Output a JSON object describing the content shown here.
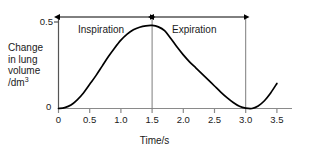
{
  "chart_data": {
    "type": "line",
    "title": "",
    "xlabel": "Time/s",
    "ylabel": "Change in lung volume /dm3",
    "ylabel_lines": [
      "Change",
      "in lung",
      "volume",
      "/dm"
    ],
    "ylabel_superscript": "3",
    "xlim": [
      0,
      3.5
    ],
    "ylim": [
      0,
      0.5
    ],
    "grid": false,
    "legend": "none",
    "xticks": [
      "0",
      "0.5",
      "1.0",
      "1.5",
      "2.0",
      "2.5",
      "3.0",
      "3.5"
    ],
    "xtick_values": [
      0,
      0.5,
      1.0,
      1.5,
      2.0,
      2.5,
      3.0,
      3.5
    ],
    "yticks": [
      "0",
      "0.5"
    ],
    "ytick_values": [
      0,
      0.5
    ],
    "series": [
      {
        "name": "Change in lung volume",
        "x": [
          0.0,
          0.1,
          0.2,
          0.3,
          0.4,
          0.5,
          0.6,
          0.7,
          0.8,
          0.9,
          1.0,
          1.1,
          1.2,
          1.3,
          1.4,
          1.5,
          1.6,
          1.7,
          1.8,
          1.9,
          2.0,
          2.1,
          2.2,
          2.3,
          2.4,
          2.5,
          2.6,
          2.7,
          2.8,
          2.9,
          3.0,
          3.1,
          3.2,
          3.3,
          3.4,
          3.5
        ],
        "values": [
          0.0,
          0.005,
          0.02,
          0.05,
          0.09,
          0.14,
          0.19,
          0.245,
          0.3,
          0.35,
          0.395,
          0.43,
          0.455,
          0.47,
          0.478,
          0.48,
          0.472,
          0.45,
          0.405,
          0.355,
          0.31,
          0.27,
          0.235,
          0.2,
          0.165,
          0.13,
          0.095,
          0.063,
          0.035,
          0.013,
          0.002,
          0.0,
          0.015,
          0.045,
          0.09,
          0.145
        ]
      }
    ],
    "annotations": [
      {
        "label": "Inspiration",
        "type": "double-headed-arrow",
        "x_start": 0.0,
        "x_end": 1.5
      },
      {
        "label": "Expiration",
        "type": "double-headed-arrow",
        "x_start": 1.5,
        "x_end": 3.0
      }
    ],
    "reference_lines": [
      {
        "x": 1.5,
        "orientation": "vertical"
      },
      {
        "x": 3.0,
        "orientation": "vertical"
      }
    ],
    "colors": {
      "curve": "#000000",
      "axis": "#555555",
      "annotation": "#000000",
      "text": "#1a1a1a",
      "background": "#ffffff"
    }
  }
}
